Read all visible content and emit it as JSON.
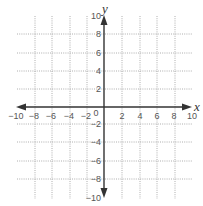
{
  "diagram": {
    "type": "coordinate-plane",
    "x_axis": {
      "label": "x",
      "min": -10,
      "max": 10,
      "step": 2,
      "tick_labels": [
        "−10",
        "−8",
        "−6",
        "−4",
        "−2",
        "2",
        "4",
        "6",
        "8",
        "10"
      ]
    },
    "y_axis": {
      "label": "y",
      "min": -10,
      "max": 10,
      "step": 2,
      "tick_labels_positive": [
        "10",
        "8",
        "6",
        "4",
        "2"
      ],
      "tick_labels_negative": [
        "−2",
        "−4",
        "−6",
        "−8",
        "−10"
      ]
    },
    "origin_label": "0",
    "colors": {
      "axis": "#333333",
      "grid": "#9a9a9a",
      "text": "#555555",
      "background": "#ffffff"
    }
  }
}
